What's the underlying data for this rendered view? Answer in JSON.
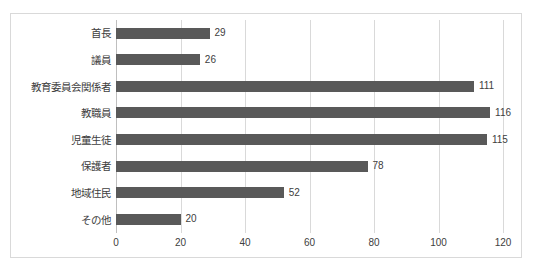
{
  "chart_data": {
    "type": "bar",
    "orientation": "horizontal",
    "title": "",
    "subtitle": "",
    "xlabel": "",
    "ylabel": "",
    "xlim": [
      0,
      120
    ],
    "xticks": [
      0,
      20,
      40,
      60,
      80,
      100,
      120
    ],
    "grid": true,
    "legend": false,
    "legend_position": "none",
    "categories": [
      "首長",
      "議員",
      "教育委員会関係者",
      "教職員",
      "児童生徒",
      "保護者",
      "地域住民",
      "その他"
    ],
    "values": [
      29,
      26,
      111,
      116,
      115,
      78,
      52,
      20
    ],
    "data_labels": [
      "29",
      "26",
      "111",
      "116",
      "115",
      "78",
      "52",
      "20"
    ],
    "series": [
      {
        "name": "",
        "values": [
          29,
          26,
          111,
          116,
          115,
          78,
          52,
          20
        ]
      }
    ]
  },
  "style": {
    "bar_color": "#595959",
    "gridline_color": "#d9d9d9",
    "axis_color": "#bfbfbf",
    "border_color": "#d9d9d9",
    "text_color": "#404040",
    "background": "#ffffff"
  }
}
